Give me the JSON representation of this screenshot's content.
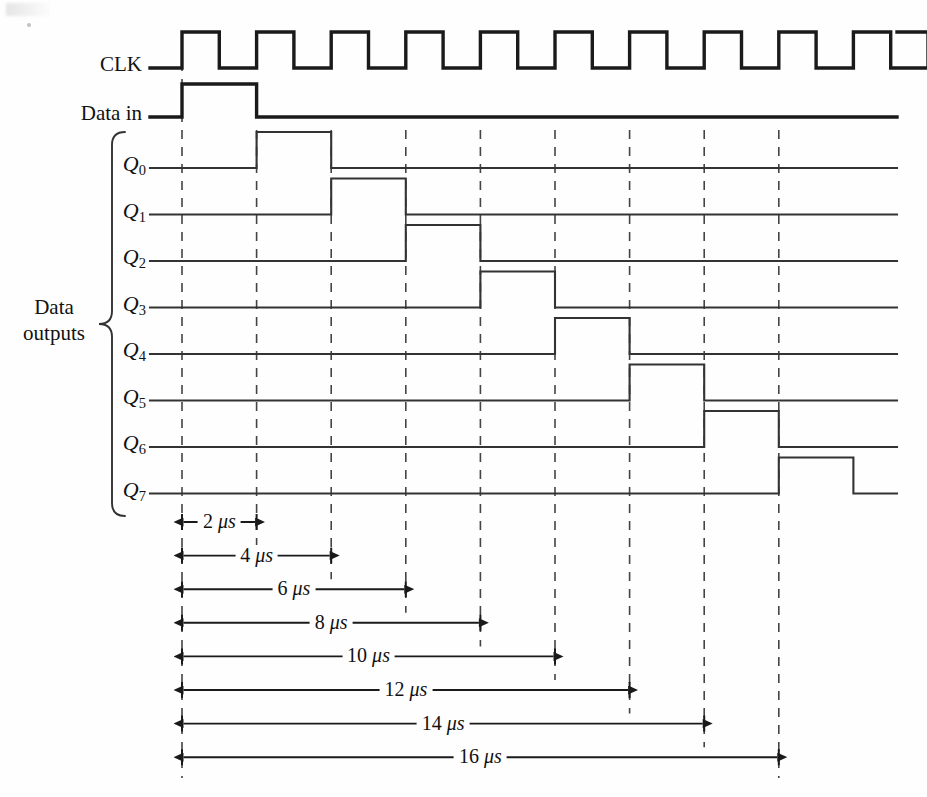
{
  "figure": {
    "type": "timing-diagram",
    "signal_labels": {
      "clk": "CLK",
      "data_in": "Data in",
      "group": [
        "Data",
        "outputs"
      ]
    },
    "output_labels": [
      {
        "base": "Q",
        "sub": "0"
      },
      {
        "base": "Q",
        "sub": "1"
      },
      {
        "base": "Q",
        "sub": "2"
      },
      {
        "base": "Q",
        "sub": "3"
      },
      {
        "base": "Q",
        "sub": "4"
      },
      {
        "base": "Q",
        "sub": "5"
      },
      {
        "base": "Q",
        "sub": "6"
      },
      {
        "base": "Q",
        "sub": "7"
      }
    ],
    "dimensions": [
      {
        "value": "2",
        "unit": "μs",
        "text": "2 μs",
        "start_us": 0,
        "end_us": 2
      },
      {
        "value": "4",
        "unit": "μs",
        "text": "4 μs",
        "start_us": 0,
        "end_us": 4
      },
      {
        "value": "6",
        "unit": "μs",
        "text": "6 μs",
        "start_us": 0,
        "end_us": 6
      },
      {
        "value": "8",
        "unit": "μs",
        "text": "8 μs",
        "start_us": 0,
        "end_us": 8
      },
      {
        "value": "10",
        "unit": "μs",
        "text": "10 μs",
        "start_us": 0,
        "end_us": 10
      },
      {
        "value": "12",
        "unit": "μs",
        "text": "12 μs",
        "start_us": 0,
        "end_us": 12
      },
      {
        "value": "14",
        "unit": "μs",
        "text": "14 μs",
        "start_us": 0,
        "end_us": 14
      },
      {
        "value": "16",
        "unit": "μs",
        "text": "16 μs",
        "start_us": 0,
        "end_us": 16
      }
    ],
    "colors": {
      "ink": "#1a1a1a",
      "thin_ink": "#333333",
      "dash": "#444444",
      "background": "#fefefe"
    }
  },
  "chart_data": {
    "type": "line",
    "xlabel": "Time (μs)",
    "ylabel": "Logic level",
    "xlim": [
      -0.2,
      19.2
    ],
    "grid": false,
    "legend": "none",
    "time_unit": "μs",
    "clock_period_us": 2,
    "clock_pulses": 10,
    "series": [
      {
        "name": "CLK",
        "kind": "clock",
        "description": "Square wave, 2 μs period, rising edges at 0,2,4,6,8,10,12,14,16,18 μs",
        "transitions_us": [
          0,
          1,
          2,
          3,
          4,
          5,
          6,
          7,
          8,
          9,
          10,
          11,
          12,
          13,
          14,
          15,
          16,
          17,
          18,
          19
        ]
      },
      {
        "name": "Data in",
        "kind": "data",
        "rise_us": 0,
        "fall_us": 2,
        "levels": [
          0,
          1,
          0
        ]
      },
      {
        "name": "Q0",
        "kind": "data",
        "rise_us": 2,
        "fall_us": 4,
        "levels": [
          0,
          1,
          0
        ]
      },
      {
        "name": "Q1",
        "kind": "data",
        "rise_us": 4,
        "fall_us": 6,
        "levels": [
          0,
          1,
          0
        ]
      },
      {
        "name": "Q2",
        "kind": "data",
        "rise_us": 6,
        "fall_us": 8,
        "levels": [
          0,
          1,
          0
        ]
      },
      {
        "name": "Q3",
        "kind": "data",
        "rise_us": 8,
        "fall_us": 10,
        "levels": [
          0,
          1,
          0
        ]
      },
      {
        "name": "Q4",
        "kind": "data",
        "rise_us": 10,
        "fall_us": 12,
        "levels": [
          0,
          1,
          0
        ]
      },
      {
        "name": "Q5",
        "kind": "data",
        "rise_us": 12,
        "fall_us": 14,
        "levels": [
          0,
          1,
          0
        ]
      },
      {
        "name": "Q6",
        "kind": "data",
        "rise_us": 14,
        "fall_us": 16,
        "levels": [
          0,
          1,
          0
        ]
      },
      {
        "name": "Q7",
        "kind": "data",
        "rise_us": 16,
        "fall_us": 18,
        "levels": [
          0,
          1,
          0
        ]
      }
    ],
    "annotations": [
      "2 μs",
      "4 μs",
      "6 μs",
      "8 μs",
      "10 μs",
      "12 μs",
      "14 μs",
      "16 μs"
    ]
  }
}
